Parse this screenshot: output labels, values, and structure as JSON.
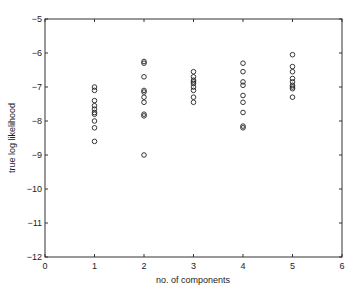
{
  "chart_data": {
    "type": "scatter",
    "title": "",
    "xlabel": "no. of components",
    "ylabel": "true log likelihood",
    "xlim": [
      0,
      6
    ],
    "ylim": [
      -12,
      -5
    ],
    "xticks": [
      0,
      1,
      2,
      3,
      4,
      5,
      6
    ],
    "yticks": [
      -12,
      -11,
      -10,
      -9,
      -8,
      -7,
      -6,
      -5
    ],
    "grid": false,
    "legend": null,
    "marker": "open-circle",
    "series": [
      {
        "name": "1 component",
        "x": 1,
        "values": [
          -7.0,
          -7.1,
          -7.4,
          -7.55,
          -7.65,
          -7.75,
          -7.8,
          -8.0,
          -8.2,
          -8.6
        ]
      },
      {
        "name": "2 components",
        "x": 2,
        "values": [
          -6.25,
          -6.3,
          -6.7,
          -7.1,
          -7.15,
          -7.3,
          -7.45,
          -7.8,
          -7.85,
          -9.0
        ]
      },
      {
        "name": "3 components",
        "x": 3,
        "values": [
          -6.55,
          -6.7,
          -6.8,
          -6.85,
          -6.9,
          -7.0,
          -7.1,
          -7.3,
          -7.45
        ]
      },
      {
        "name": "4 components",
        "x": 4,
        "values": [
          -6.3,
          -6.55,
          -6.85,
          -6.95,
          -7.25,
          -7.45,
          -7.75,
          -8.15,
          -8.2
        ]
      },
      {
        "name": "5 components",
        "x": 5,
        "values": [
          -6.05,
          -6.4,
          -6.55,
          -6.75,
          -6.85,
          -6.95,
          -7.0,
          -7.05,
          -7.3
        ]
      }
    ]
  },
  "axes": {
    "xlabel": "no. of components",
    "ylabel": "true log likelihood"
  }
}
